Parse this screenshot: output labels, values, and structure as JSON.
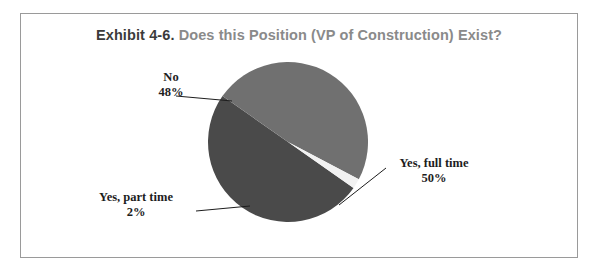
{
  "figure": {
    "title_prefix": "Exhibit 4-6.",
    "title_rest": "Does this Position (VP of Construction) Exist?",
    "background_color": "#ffffff",
    "border_color": "#9a9a9a"
  },
  "labels": {
    "no_name": "No",
    "no_pct": "48%",
    "full_name": "Yes, full time",
    "full_pct": "50%",
    "part_name": "Yes, part time",
    "part_pct": "2%"
  },
  "chart_data": {
    "type": "pie",
    "title": "Exhibit 4-6.  Does this Position (VP of Construction) Exist?",
    "xlabel": "",
    "ylabel": "",
    "grid": false,
    "legend_position": "none",
    "labels_position": "callout-outside",
    "categories": [
      "Yes, full time",
      "No",
      "Yes, part time"
    ],
    "values": [
      50,
      48,
      2
    ],
    "units": "percent",
    "colors": [
      "#4a4a4a",
      "#707070",
      "#f2f2f2"
    ],
    "slice_labels": [
      "Yes, full time\n50%",
      "No\n48%",
      "Yes, part time\n2%"
    ],
    "start_angle_deg": 35,
    "direction": "clockwise"
  }
}
